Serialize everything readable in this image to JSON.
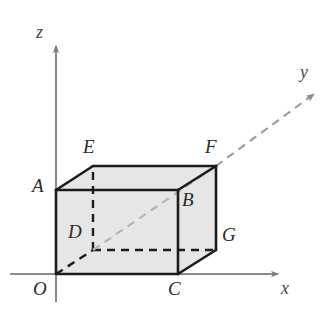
{
  "figure": {
    "kind": "geometry-diagram",
    "background_color": "#ffffff"
  },
  "axes": {
    "x": {
      "label": "x",
      "label_pos": {
        "x": 281,
        "y": 279
      },
      "color": "#8a8a8a",
      "style": "solid",
      "start": {
        "x": 10,
        "y": 274
      },
      "end": {
        "x": 278,
        "y": 274
      },
      "arrow": true
    },
    "y": {
      "label": "y",
      "label_pos": {
        "x": 300,
        "y": 63
      },
      "color": "#9a9a9a",
      "style": "dashed",
      "start": {
        "x": 56,
        "y": 274
      },
      "end": {
        "x": 316,
        "y": 92
      },
      "arrow": true
    },
    "z": {
      "label": "z",
      "label_pos": {
        "x": 36,
        "y": 23
      },
      "color": "#8a8a8a",
      "style": "solid",
      "start": {
        "x": 56,
        "y": 302
      },
      "end": {
        "x": 56,
        "y": 46
      },
      "arrow": true
    }
  },
  "solid": {
    "name": "rectangular-box",
    "fill_color": "#e6e6e6",
    "edge_color": "#1c1c1c",
    "hidden_edge_color": "#1c1c1c",
    "hidden_edge_style": "dashed",
    "interior_diagonal_color": "#b5b5b5"
  },
  "vertices": [
    {
      "id": "O",
      "label": "O",
      "x": 56,
      "y": 274,
      "label_x": 33,
      "label_y": 279,
      "hidden": false
    },
    {
      "id": "A",
      "label": "A",
      "x": 56,
      "y": 190,
      "label_x": 32,
      "label_y": 176,
      "hidden": false
    },
    {
      "id": "B",
      "label": "B",
      "x": 178,
      "y": 190,
      "label_x": 182,
      "label_y": 190,
      "hidden": false
    },
    {
      "id": "C",
      "label": "C",
      "x": 178,
      "y": 274,
      "label_x": 168,
      "label_y": 279,
      "hidden": false
    },
    {
      "id": "D",
      "label": "D",
      "x": 93,
      "y": 250,
      "label_x": 68,
      "label_y": 222,
      "hidden": true
    },
    {
      "id": "E",
      "label": "E",
      "x": 93,
      "y": 166,
      "label_x": 83,
      "label_y": 137,
      "hidden": false
    },
    {
      "id": "F",
      "label": "F",
      "x": 216,
      "y": 166,
      "label_x": 205,
      "label_y": 137,
      "hidden": false
    },
    {
      "id": "G",
      "label": "G",
      "x": 216,
      "y": 250,
      "label_x": 222,
      "label_y": 225,
      "hidden": false
    }
  ],
  "edges": [
    {
      "from": "O",
      "to": "A",
      "hidden": false
    },
    {
      "from": "A",
      "to": "B",
      "hidden": false
    },
    {
      "from": "B",
      "to": "C",
      "hidden": false
    },
    {
      "from": "C",
      "to": "O",
      "hidden": false
    },
    {
      "from": "A",
      "to": "E",
      "hidden": false
    },
    {
      "from": "B",
      "to": "F",
      "hidden": false
    },
    {
      "from": "C",
      "to": "G",
      "hidden": false
    },
    {
      "from": "E",
      "to": "F",
      "hidden": false
    },
    {
      "from": "F",
      "to": "G",
      "hidden": false
    },
    {
      "from": "O",
      "to": "D",
      "hidden": true
    },
    {
      "from": "D",
      "to": "E",
      "hidden": true
    },
    {
      "from": "D",
      "to": "G",
      "hidden": true
    }
  ],
  "interior_lines": [
    {
      "from": "D",
      "to": "F",
      "style": "dashed",
      "note": "y-axis passing through the box interior"
    }
  ],
  "faces": [
    {
      "name": "front-face-OABC",
      "vertices": [
        "O",
        "A",
        "B",
        "C"
      ]
    },
    {
      "name": "top-face-AEFB",
      "vertices": [
        "A",
        "E",
        "F",
        "B"
      ]
    },
    {
      "name": "right-face-BFGC",
      "vertices": [
        "B",
        "F",
        "G",
        "C"
      ]
    }
  ]
}
